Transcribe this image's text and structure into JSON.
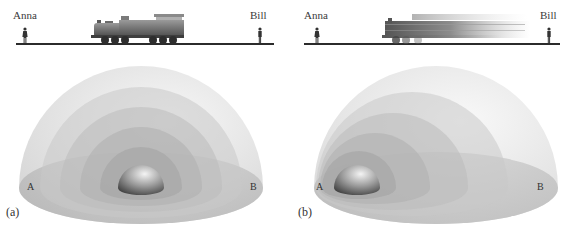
{
  "figure": {
    "type": "physics-illustration",
    "topic": "light wavefronts emitted from a train relative to observers",
    "panels": [
      {
        "label": "(a)",
        "observers": {
          "left": "Anna",
          "right": "Bill"
        },
        "train_state": "stationary",
        "points": {
          "left": "A",
          "right": "B"
        },
        "wavefronts": "concentric"
      },
      {
        "label": "(b)",
        "observers": {
          "left": "Anna",
          "right": "Bill"
        },
        "train_state": "moving-right (motion blur)",
        "points": {
          "left": "A",
          "right": "B"
        },
        "wavefronts": "shifted toward B"
      }
    ]
  },
  "colors": {
    "track": "#2b2b2b",
    "train": "#6e6e6e",
    "dome_shell": "#bdbdbd",
    "core_sphere": "#8a8a8a",
    "background": "#ffffff"
  }
}
